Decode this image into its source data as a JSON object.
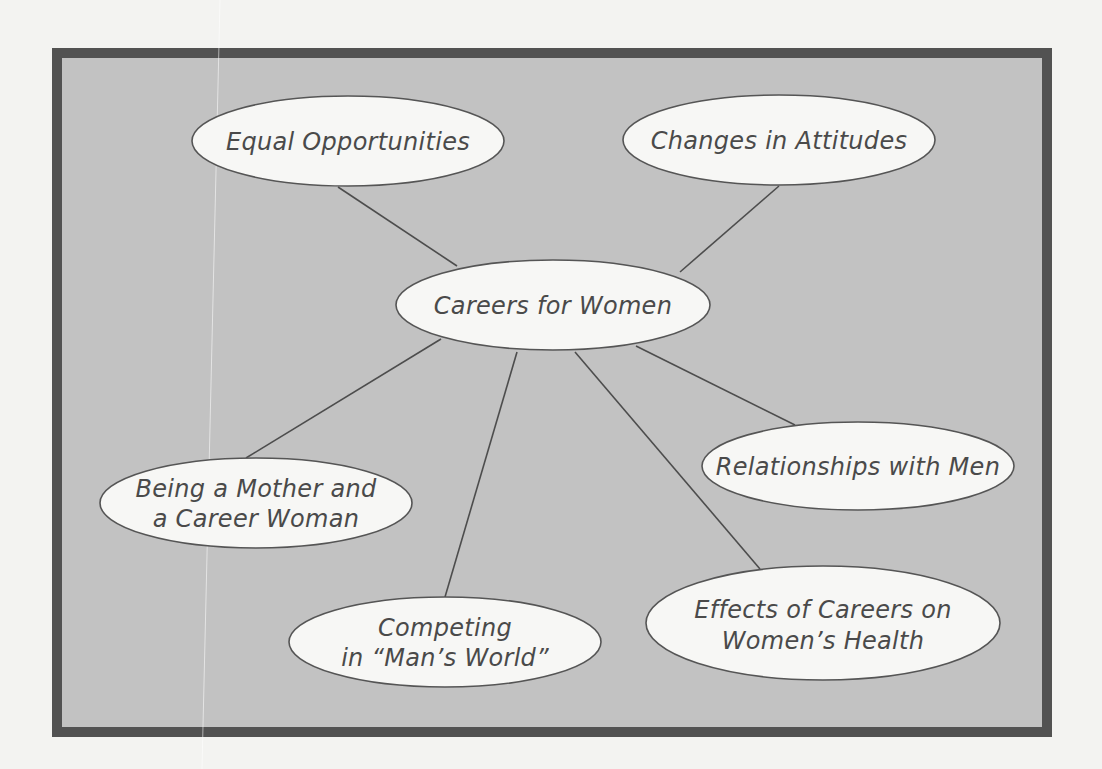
{
  "diagram": {
    "type": "concept-map",
    "colors": {
      "page_background": "#f3f3f1",
      "frame_border": "#525252",
      "frame_fill": "#c2c2c2",
      "node_fill": "#f7f7f5",
      "node_stroke": "#555555",
      "text": "#4a4a4a",
      "connector": "#4d4d4d"
    },
    "center": {
      "id": "careers-for-women",
      "lines": [
        "Careers for Women"
      ]
    },
    "nodes": [
      {
        "id": "equal-opportunities",
        "lines": [
          "Equal Opportunities"
        ]
      },
      {
        "id": "changes-in-attitudes",
        "lines": [
          "Changes in Attitudes"
        ]
      },
      {
        "id": "relationships-with-men",
        "lines": [
          "Relationships with Men"
        ]
      },
      {
        "id": "being-a-mother",
        "lines": [
          "Being a Mother and",
          "a Career Woman"
        ]
      },
      {
        "id": "competing-mans-world",
        "lines": [
          "Competing",
          "in “Man’s World”"
        ]
      },
      {
        "id": "effects-on-health",
        "lines": [
          "Effects of Careers on",
          "Women’s Health"
        ]
      }
    ],
    "edges": [
      {
        "from": "careers-for-women",
        "to": "equal-opportunities"
      },
      {
        "from": "careers-for-women",
        "to": "changes-in-attitudes"
      },
      {
        "from": "careers-for-women",
        "to": "relationships-with-men"
      },
      {
        "from": "careers-for-women",
        "to": "being-a-mother"
      },
      {
        "from": "careers-for-women",
        "to": "competing-mans-world"
      },
      {
        "from": "careers-for-women",
        "to": "effects-on-health"
      }
    ]
  }
}
